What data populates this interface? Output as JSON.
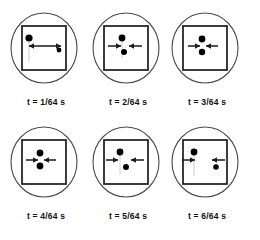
{
  "figure": {
    "colors": {
      "stroke": "#1a1a1a",
      "dot": "#000000",
      "background": "#ffffff",
      "circle_stroke": "#4a4a4a"
    },
    "layout": {
      "rows": 2,
      "columns": 3,
      "panel_count": 6
    }
  },
  "panels": [
    {
      "id": "panel-1",
      "caption": "t = 1/64 s",
      "frame_shape": "square-in-circle",
      "dots": [
        {
          "name": "large-dot",
          "cx": 22,
          "cy": 30,
          "r": 3.6
        },
        {
          "name": "small-dot",
          "cx": 52,
          "cy": 42,
          "r": 2.4
        }
      ],
      "arrows": [
        {
          "name": "double-arrow-horizontal",
          "x1": 22,
          "y1": 38,
          "x2": 54,
          "y2": 38,
          "heads": "both"
        }
      ],
      "trail": {
        "x": 22,
        "y": 32,
        "x2": 22,
        "y2": 54
      }
    },
    {
      "id": "panel-2",
      "caption": "t = 2/64 s",
      "frame_shape": "square-in-circle",
      "dots": [
        {
          "name": "upper-dot",
          "cx": 33,
          "cy": 30,
          "r": 3.4
        },
        {
          "name": "lower-dot",
          "cx": 35,
          "cy": 44,
          "r": 3.0
        }
      ],
      "arrows": [
        {
          "name": "arrow-from-left",
          "x1": 19,
          "y1": 38,
          "x2": 32,
          "y2": 38,
          "heads": "start"
        },
        {
          "name": "arrow-from-right",
          "x1": 53,
          "y1": 38,
          "x2": 40,
          "y2": 38,
          "heads": "start"
        }
      ],
      "trail": {
        "x": 33,
        "y": 32,
        "x2": 33,
        "y2": 50
      }
    },
    {
      "id": "panel-3",
      "caption": "t = 3/64 s",
      "frame_shape": "square-in-circle",
      "dots": [
        {
          "name": "upper-dot",
          "cx": 34,
          "cy": 31,
          "r": 3.4
        },
        {
          "name": "lower-dot",
          "cx": 34,
          "cy": 44,
          "r": 3.2
        }
      ],
      "arrows": [
        {
          "name": "arrow-from-left",
          "x1": 20,
          "y1": 38,
          "x2": 32,
          "y2": 38,
          "heads": "start"
        },
        {
          "name": "arrow-from-right",
          "x1": 50,
          "y1": 38,
          "x2": 38,
          "y2": 38,
          "heads": "start"
        }
      ],
      "trail": null
    },
    {
      "id": "panel-4",
      "caption": "t = 4/64 s",
      "frame_shape": "square-in-circle",
      "dots": [
        {
          "name": "upper-dot",
          "cx": 33,
          "cy": 31,
          "r": 3.4
        },
        {
          "name": "lower-dot",
          "cx": 33,
          "cy": 44,
          "r": 3.4
        }
      ],
      "arrows": [
        {
          "name": "arrow-from-left",
          "x1": 19,
          "y1": 38,
          "x2": 31,
          "y2": 38,
          "heads": "start"
        },
        {
          "name": "arrow-from-right",
          "x1": 49,
          "y1": 38,
          "x2": 37,
          "y2": 38,
          "heads": "start"
        }
      ],
      "trail": null
    },
    {
      "id": "panel-5",
      "caption": "t = 5/64 s",
      "frame_shape": "square-in-circle",
      "dots": [
        {
          "name": "upper-dot",
          "cx": 31,
          "cy": 30,
          "r": 3.4
        },
        {
          "name": "lower-dot",
          "cx": 37,
          "cy": 45,
          "r": 3.0
        }
      ],
      "arrows": [
        {
          "name": "arrow-from-left",
          "x1": 17,
          "y1": 38,
          "x2": 29,
          "y2": 38,
          "heads": "start"
        },
        {
          "name": "arrow-from-right",
          "x1": 55,
          "y1": 38,
          "x2": 42,
          "y2": 38,
          "heads": "start"
        }
      ],
      "trail": {
        "x": 31,
        "y": 32,
        "x2": 31,
        "y2": 52
      }
    },
    {
      "id": "panel-6",
      "caption": "t = 6/64 s",
      "frame_shape": "square-in-circle",
      "dots": [
        {
          "name": "left-dot",
          "cx": 26,
          "cy": 30,
          "r": 3.4
        },
        {
          "name": "right-dot",
          "cx": 48,
          "cy": 45,
          "r": 2.8
        }
      ],
      "arrows": [
        {
          "name": "arrow-from-left",
          "x1": 14,
          "y1": 38,
          "x2": 27,
          "y2": 38,
          "heads": "start"
        },
        {
          "name": "arrow-from-right",
          "x1": 57,
          "y1": 38,
          "x2": 44,
          "y2": 38,
          "heads": "start"
        }
      ],
      "trail": {
        "x": 26,
        "y": 32,
        "x2": 26,
        "y2": 54
      }
    }
  ]
}
